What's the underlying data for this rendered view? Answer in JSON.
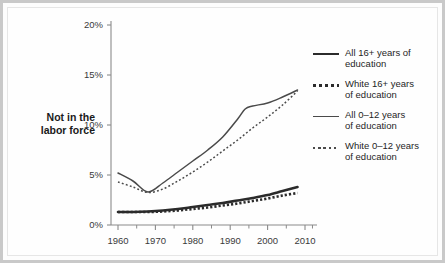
{
  "figure": {
    "y_axis_title": "Not in the\nlabor force",
    "y_axis_title_line1": "Not in the",
    "y_axis_title_line2": "labor force"
  },
  "legend": {
    "position": "right",
    "items": [
      {
        "label_line1": "All 16+ years of",
        "label_line2": "education",
        "style": "solid-thick",
        "swatch": "solid-thick-swatch"
      },
      {
        "label_line1": "White 16+ years",
        "label_line2": "of education",
        "style": "dotted-thick",
        "swatch": "dotted-thick-swatch"
      },
      {
        "label_line1": "All 0–12 years",
        "label_line2": "of education",
        "style": "solid-thin",
        "swatch": "solid-thin-swatch"
      },
      {
        "label_line1": "White 0–12 years",
        "label_line2": "of education",
        "style": "dotted-thin",
        "swatch": "dotted-thin-swatch"
      }
    ]
  },
  "axes": {
    "y_ticks": [
      "0%",
      "5%",
      "10%",
      "15%",
      "20%"
    ],
    "x_ticks": [
      "1960",
      "1970",
      "1980",
      "1990",
      "2000",
      "2010"
    ]
  },
  "colors": {
    "line_dark": "#2b2b2b",
    "line_mid": "#4a4a4a",
    "axis": "#8a8a8a",
    "frame": "#c9c9c9",
    "background": "#fdfdfd",
    "text": "#1f1f1f"
  },
  "chart_data": {
    "type": "line",
    "title": "",
    "xlabel": "",
    "ylabel": "Not in the labor force",
    "xlim": [
      1958,
      2012
    ],
    "ylim": [
      0,
      20
    ],
    "yticks": [
      0,
      5,
      10,
      15,
      20
    ],
    "ytick_labels": [
      "0%",
      "5%",
      "10%",
      "15%",
      "20%"
    ],
    "xticks": [
      1960,
      1970,
      1980,
      1990,
      2000,
      2010
    ],
    "xtick_labels": [
      "1960",
      "1970",
      "1980",
      "1990",
      "2000",
      "2010"
    ],
    "xminor_ticks": [
      1965,
      1975,
      1985,
      1995,
      2005
    ],
    "grid": false,
    "legend_position": "right",
    "y_unit": "percent",
    "series": [
      {
        "name": "All 16+ years of education",
        "style": "solid",
        "width": "thick",
        "color": "#2b2b2b",
        "x": [
          1960,
          1964,
          1968,
          1972,
          1976,
          1980,
          1984,
          1988,
          1992,
          1996,
          2000,
          2004,
          2008
        ],
        "values": [
          1.3,
          1.3,
          1.35,
          1.45,
          1.6,
          1.8,
          2.0,
          2.2,
          2.45,
          2.7,
          3.0,
          3.4,
          3.8
        ]
      },
      {
        "name": "White 16+ years of education",
        "style": "dotted",
        "width": "thick",
        "color": "#2b2b2b",
        "x": [
          1960,
          1964,
          1968,
          1972,
          1976,
          1980,
          1984,
          1988,
          1992,
          1996,
          2000,
          2004,
          2008
        ],
        "values": [
          1.3,
          1.3,
          1.3,
          1.35,
          1.45,
          1.6,
          1.75,
          1.95,
          2.15,
          2.4,
          2.65,
          2.95,
          3.2
        ]
      },
      {
        "name": "All 0–12 years of education",
        "style": "solid",
        "width": "thin",
        "color": "#4a4a4a",
        "x": [
          1960,
          1964,
          1968,
          1972,
          1976,
          1980,
          1984,
          1988,
          1992,
          1994,
          1996,
          2000,
          2004,
          2008
        ],
        "values": [
          5.2,
          4.4,
          3.3,
          4.2,
          5.3,
          6.4,
          7.5,
          8.8,
          10.6,
          11.6,
          11.9,
          12.2,
          12.8,
          13.5
        ]
      },
      {
        "name": "White 0–12 years of education",
        "style": "dotted",
        "width": "thin",
        "color": "#4a4a4a",
        "x": [
          1960,
          1964,
          1968,
          1972,
          1976,
          1980,
          1984,
          1988,
          1992,
          1996,
          2000,
          2004,
          2008
        ],
        "values": [
          4.3,
          3.8,
          3.25,
          3.6,
          4.4,
          5.3,
          6.3,
          7.4,
          8.5,
          9.7,
          10.8,
          12.0,
          13.4
        ]
      }
    ]
  }
}
